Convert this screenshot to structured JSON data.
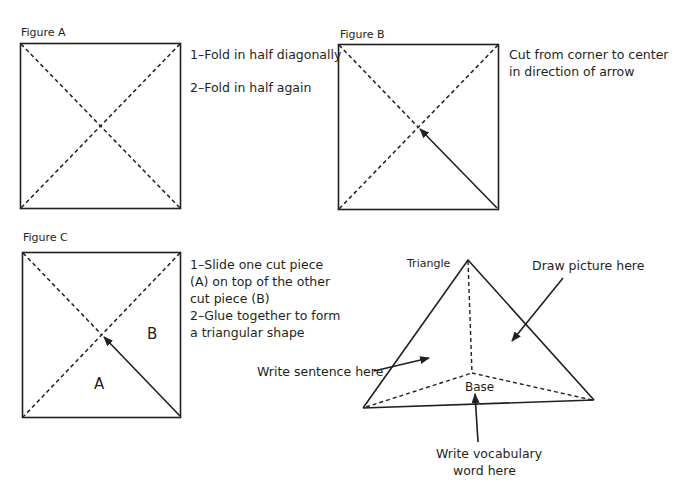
{
  "figure_a": {
    "title": "Figure A",
    "steps": [
      "1–Fold in half diagonally",
      "2–Fold in half again"
    ]
  },
  "figure_b": {
    "title": "Figure B",
    "instruction_lines": [
      "Cut from corner to center",
      "in direction of arrow"
    ]
  },
  "figure_c": {
    "title": "Figure C",
    "piece_a": "A",
    "piece_b": "B",
    "instruction_lines": [
      "1–Slide one cut piece",
      "(A) on top of the other",
      "cut piece (B)",
      "2–Glue together to form",
      "a triangular shape"
    ]
  },
  "pyramid": {
    "apex_label": "Triangle",
    "base_label": "Base",
    "draw_label": "Draw picture here",
    "sentence_label": "Write sentence here",
    "vocab_lines": [
      "Write vocabulary",
      "word here"
    ]
  },
  "colors": {
    "ink": "#231f20",
    "background": "#ffffff"
  }
}
